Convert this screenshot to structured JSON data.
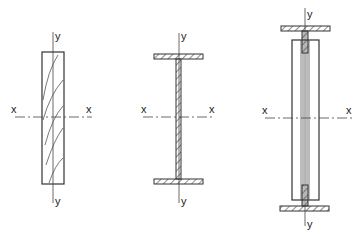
{
  "diagram": {
    "figures": [
      {
        "id": "solid-rectangular-section",
        "labels": {
          "y_top": "y",
          "y_bottom": "y",
          "x_left": "x",
          "x_right": "x"
        }
      },
      {
        "id": "i-beam-section",
        "labels": {
          "y_top": "y",
          "y_bottom": "y",
          "x_left": "x",
          "x_right": "x"
        }
      },
      {
        "id": "composite-i-section",
        "labels": {
          "y_top": "y",
          "y_bottom": "y",
          "x_left": "x",
          "x_right": "x"
        }
      }
    ],
    "colors": {
      "line": "#333333",
      "background": "#ffffff"
    }
  }
}
